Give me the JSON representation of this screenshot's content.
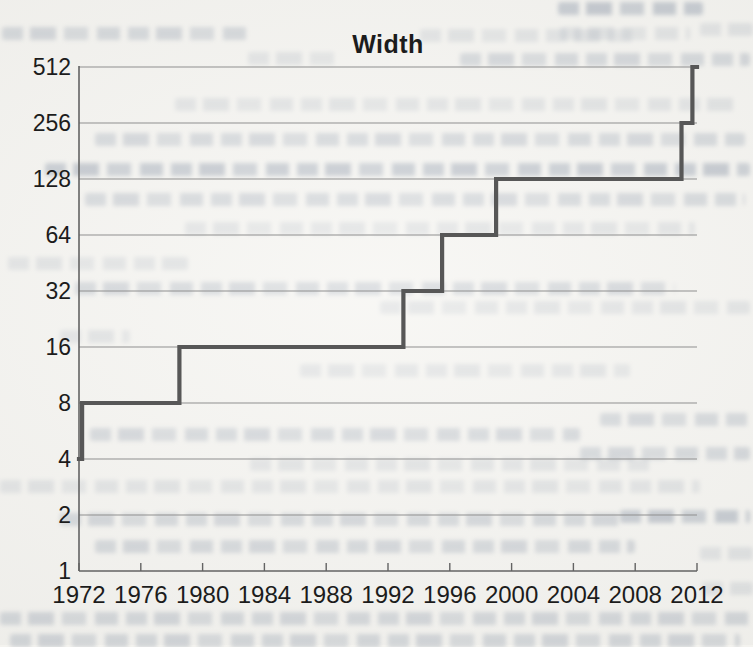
{
  "chart_data": {
    "type": "line",
    "subtype": "step",
    "title": "Width",
    "xlabel": "",
    "ylabel": "",
    "x_ticks": [
      1972,
      1976,
      1980,
      1984,
      1988,
      1992,
      1996,
      2000,
      2004,
      2008,
      2012
    ],
    "y_ticks": [
      1,
      2,
      4,
      8,
      16,
      32,
      64,
      128,
      256,
      512
    ],
    "x_range": [
      1972,
      2012
    ],
    "y_range": [
      1,
      512
    ],
    "y_scale": "log2",
    "grid": "horizontal",
    "legend": "none",
    "series": [
      {
        "name": "Width",
        "steps": [
          {
            "year": 1972,
            "width": 4
          },
          {
            "year": 1972.2,
            "width": 8
          },
          {
            "year": 1978.5,
            "width": 16
          },
          {
            "year": 1993,
            "width": 32
          },
          {
            "year": 1995.5,
            "width": 64
          },
          {
            "year": 1999,
            "width": 128
          },
          {
            "year": 2011,
            "width": 256
          },
          {
            "year": 2011.7,
            "width": 512
          }
        ],
        "end_year": 2012
      }
    ]
  },
  "colors": {
    "paper": "#f4f3ef",
    "step_line": "#575757",
    "gridline": "#8f8f8f",
    "axis": "#636363",
    "label_text": "#1c1c1c"
  }
}
